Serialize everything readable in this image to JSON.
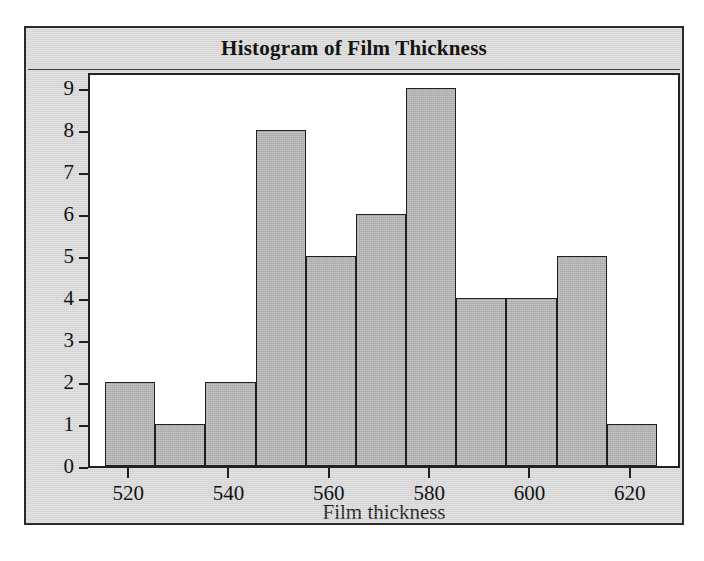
{
  "figure": {
    "background_color": "#ffffff",
    "panel_color": "#d9d9d9",
    "border_color": "#2b2b2b",
    "bar_fill_color": "#b2b2b2",
    "bar_edge_color": "#1f1f1f"
  },
  "chart_data": {
    "type": "bar",
    "title": "Histogram of Film Thickness",
    "xlabel": "Film thickness",
    "ylabel": "Frequency",
    "xlim": [
      512,
      630
    ],
    "ylim": [
      0,
      9.4
    ],
    "grid": false,
    "legend": null,
    "bin_width": 10,
    "bin_edges": [
      515,
      525,
      535,
      545,
      555,
      565,
      575,
      585,
      595,
      605,
      615,
      625
    ],
    "categories": [
      "515-525",
      "525-535",
      "535-545",
      "545-555",
      "555-565",
      "565-575",
      "575-585",
      "585-595",
      "595-605",
      "605-615",
      "615-625"
    ],
    "values": [
      2,
      1,
      2,
      8,
      5,
      6,
      9,
      4,
      4,
      5,
      1
    ],
    "xticks": [
      520,
      540,
      560,
      580,
      600,
      620
    ],
    "xtick_labels": [
      "520",
      "540",
      "560",
      "580",
      "600",
      "620"
    ],
    "yticks": [
      0,
      1,
      2,
      3,
      4,
      5,
      6,
      7,
      8,
      9
    ],
    "ytick_labels": [
      "0",
      "1",
      "2",
      "3",
      "4",
      "5",
      "6",
      "7",
      "8",
      "9"
    ],
    "total_count": 47
  }
}
